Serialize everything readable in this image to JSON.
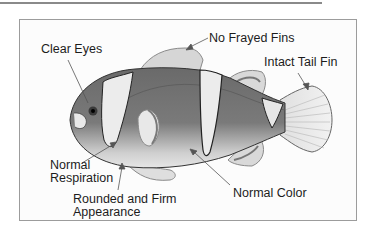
{
  "diagram": {
    "labels": {
      "clear_eyes": "Clear Eyes",
      "no_frayed_fins": "No Frayed Fins",
      "intact_tail_fin": "Intact Tail Fin",
      "normal_respiration_line1": "Normal",
      "normal_respiration_line2": "Respiration",
      "rounded_line1": "Rounded and Firm",
      "rounded_line2": "Appearance",
      "normal_color": "Normal Color"
    },
    "colors": {
      "body_dark": "#6e6e6e",
      "body_light": "#e4e4e4",
      "stripe": "#ececec",
      "fin": "#d8d8d8",
      "fin_edge": "#8a8a8a",
      "outline": "#333333",
      "frame_border": "#9c9c9c"
    }
  }
}
